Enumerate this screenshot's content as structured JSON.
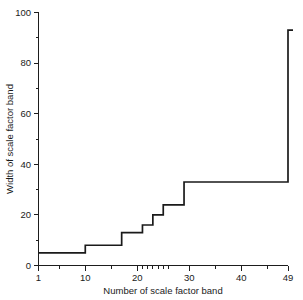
{
  "chart_data": {
    "type": "line",
    "subtype": "step",
    "title": "",
    "xlabel": "Number of scale factor band",
    "ylabel": "Width of scale factor band",
    "xlim": [
      1,
      49
    ],
    "ylim": [
      0,
      100
    ],
    "grid": false,
    "legend": null,
    "x_ticklabels": [
      "1",
      "10",
      "20",
      "30",
      "40",
      "49"
    ],
    "x_tickvalues": [
      1,
      10,
      20,
      30,
      40,
      49
    ],
    "x_minor_tickvalues": [
      5,
      15,
      21,
      22,
      23,
      24,
      25,
      26,
      35,
      45
    ],
    "y_ticklabels": [
      "0",
      "20",
      "40",
      "60",
      "80",
      "100"
    ],
    "y_tickvalues": [
      0,
      20,
      40,
      60,
      80,
      100
    ],
    "y_minor_tickvalues": [
      10,
      30,
      50,
      70,
      90
    ],
    "x": [
      1,
      2,
      3,
      4,
      5,
      6,
      7,
      8,
      9,
      10,
      11,
      12,
      13,
      14,
      15,
      16,
      17,
      18,
      19,
      20,
      21,
      22,
      23,
      24,
      25,
      26,
      27,
      28,
      29,
      30,
      31,
      32,
      33,
      34,
      35,
      36,
      37,
      38,
      39,
      40,
      41,
      42,
      43,
      44,
      45,
      46,
      47,
      48,
      49
    ],
    "values": [
      5,
      5,
      5,
      5,
      5,
      5,
      5,
      5,
      5,
      8,
      8,
      8,
      8,
      8,
      8,
      8,
      13,
      13,
      13,
      13,
      16,
      16,
      20,
      20,
      24,
      24,
      24,
      24,
      33,
      33,
      33,
      33,
      33,
      33,
      33,
      33,
      33,
      33,
      33,
      33,
      33,
      33,
      33,
      33,
      33,
      33,
      33,
      33,
      93
    ],
    "series": [
      {
        "name": "Width of scale factor band",
        "values": [
          5,
          5,
          5,
          5,
          5,
          5,
          5,
          5,
          5,
          8,
          8,
          8,
          8,
          8,
          8,
          8,
          13,
          13,
          13,
          13,
          16,
          16,
          20,
          20,
          24,
          24,
          24,
          24,
          33,
          33,
          33,
          33,
          33,
          33,
          33,
          33,
          33,
          33,
          33,
          33,
          33,
          33,
          33,
          33,
          33,
          33,
          33,
          33,
          93
        ]
      }
    ],
    "steps": [
      {
        "from_band": 1,
        "to_band": 9,
        "width": 5
      },
      {
        "from_band": 10,
        "to_band": 16,
        "width": 8
      },
      {
        "from_band": 17,
        "to_band": 20,
        "width": 13
      },
      {
        "from_band": 21,
        "to_band": 22,
        "width": 16
      },
      {
        "from_band": 23,
        "to_band": 24,
        "width": 20
      },
      {
        "from_band": 25,
        "to_band": 28,
        "width": 24
      },
      {
        "from_band": 29,
        "to_band": 48,
        "width": 33
      },
      {
        "from_band": 49,
        "to_band": 49,
        "width": 93
      }
    ],
    "colors": {
      "line": "#1a1a1a",
      "axis": "#1d1d1d",
      "background": "#ffffff"
    }
  }
}
